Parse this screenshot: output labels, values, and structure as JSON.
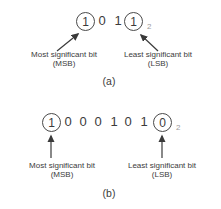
{
  "figure": {
    "colors": {
      "text": "#3b3b3b",
      "circle_stroke": "#4a4a4a",
      "arrow": "#3a3a3a",
      "subscript_gray": "#9b9b9b",
      "background": "#ffffff"
    },
    "part_a": {
      "bits": [
        "1",
        "0",
        "1",
        "1"
      ],
      "circled_positions": "first and last bit",
      "subscript": "2",
      "msb": {
        "line1": "Most significant bit",
        "line2": "(MSB)"
      },
      "lsb": {
        "line1": "Least significant bit",
        "line2": "(LSB)"
      },
      "caption": "(a)"
    },
    "part_b": {
      "bits": [
        "1",
        "0",
        "0",
        "0",
        "1",
        "0",
        "1",
        "0"
      ],
      "circled_positions": "first and last bit",
      "subscript": "2",
      "msb": {
        "line1": "Most significant bit",
        "line2": "(MSB)"
      },
      "lsb": {
        "line1": "Least significant bit",
        "line2": "(LSB)"
      },
      "caption": "(b)"
    }
  }
}
